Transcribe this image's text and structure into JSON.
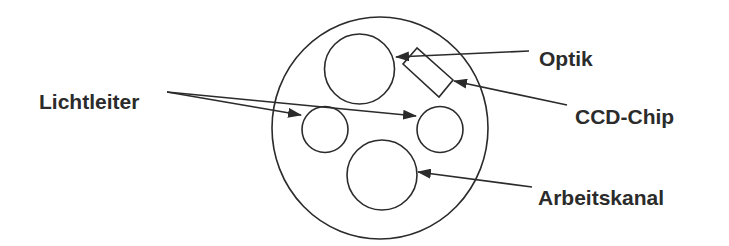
{
  "diagram": {
    "type": "cross-section of endoscope tip",
    "labels": {
      "lichtleiter": "Lichtleiter",
      "optik": "Optik",
      "ccd_chip": "CCD-Chip",
      "arbeitskanal": "Arbeitskanal"
    },
    "components": [
      {
        "name": "outer-sheath",
        "shape": "circle"
      },
      {
        "name": "optik",
        "shape": "circle"
      },
      {
        "name": "ccd-chip",
        "shape": "rectangle"
      },
      {
        "name": "lichtleiter-left",
        "shape": "circle"
      },
      {
        "name": "lichtleiter-right",
        "shape": "circle"
      },
      {
        "name": "arbeitskanal",
        "shape": "circle"
      }
    ],
    "colors": {
      "stroke": "#2b2b2b",
      "background": "#ffffff"
    }
  }
}
